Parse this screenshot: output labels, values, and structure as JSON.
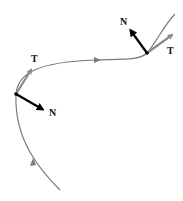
{
  "diagram": {
    "colors": {
      "curve": "#7a7a7a",
      "tangent": "#8a8a8a",
      "normal": "#000000",
      "label": "#111111",
      "point": "#000000"
    },
    "points": [
      {
        "id": "p1",
        "tangent_label": "T",
        "normal_label": "N"
      },
      {
        "id": "p2",
        "tangent_label": "T",
        "normal_label": "N"
      }
    ]
  }
}
